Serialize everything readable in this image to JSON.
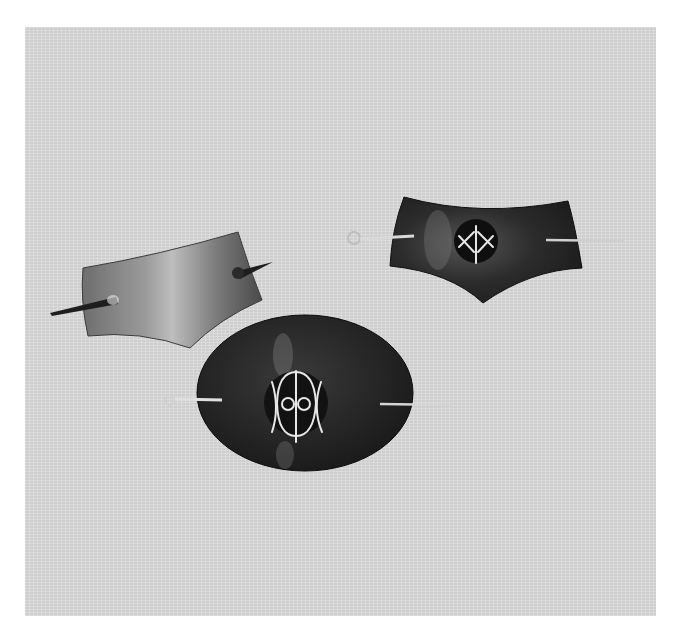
{
  "image": {
    "description": "Black-and-white photograph of three leather hair barrettes with stick pins on a light gray background",
    "background_color": "#dcdcdc",
    "page_color": "#ffffff"
  },
  "objects": [
    {
      "name": "left-barrette",
      "shape": "concave rectangular (curved top and bottom)",
      "tone": "medium gray leather with highlight",
      "pin": "dark wooden stick, pointed"
    },
    {
      "name": "right-barrette",
      "shape": "shield / pointed bottom with concave top",
      "tone": "dark leather",
      "emblem": "circular inset with white X and triangle line glyph",
      "pin": "light metal stick with loop end"
    },
    {
      "name": "center-barrette",
      "shape": "oval",
      "tone": "very dark leather",
      "emblem": "circular inset with white glyph: vertical line, two circles, crossing arcs",
      "pin": "light metal stick with loop end"
    }
  ]
}
